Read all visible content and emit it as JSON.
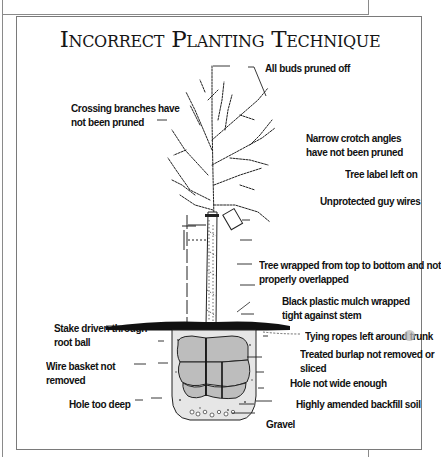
{
  "title": "Incorrect Planting Technique",
  "labels": {
    "all_buds": "All buds pruned off",
    "crossing_1": "Crossing branches have",
    "crossing_2": "not been pruned",
    "narrow_1": "Narrow crotch angles",
    "narrow_2": "have not been pruned",
    "tree_label": "Tree label left on",
    "guy_wires": "Unprotected guy wires",
    "wrapped_1": "Tree wrapped from top to bottom and not",
    "wrapped_2": "properly overlapped",
    "mulch_1": "Black plastic mulch wrapped",
    "mulch_2": "tight against stem",
    "stake_1": "Stake driven through",
    "stake_2": "root ball",
    "ropes": "Tying ropes left around trunk",
    "burlap_1": "Treated burlap not removed or",
    "burlap_2": "sliced",
    "basket_1": "Wire basket not",
    "basket_2": "removed",
    "hole_narrow": "Hole not wide enough",
    "hole_deep": "Hole too deep",
    "backfill": "Highly amended backfill soil",
    "gravel": "Gravel"
  },
  "colors": {
    "ink": "#111111",
    "frame": "#8a8a8a",
    "soil_fill": "#d9d9d9",
    "mulch": "#111111"
  }
}
